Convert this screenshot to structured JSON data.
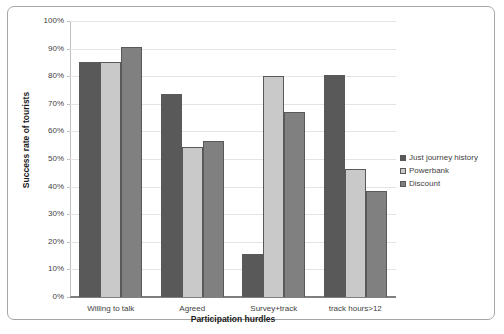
{
  "chart_data": {
    "type": "bar",
    "title": "",
    "xlabel": "Participation hurdles",
    "ylabel": "Success rate of tourists",
    "categories": [
      "Willing to talk",
      "Agreed",
      "Survey+track",
      "track hours>12"
    ],
    "series": [
      {
        "name": "Just journey history",
        "color": "#595959",
        "values": [
          85,
          73.5,
          15.5,
          80.5
        ]
      },
      {
        "name": "Powerbank",
        "color": "#c9c9c9",
        "values": [
          85,
          54.5,
          80,
          46.5
        ]
      },
      {
        "name": "Discount",
        "color": "#808080",
        "values": [
          90.5,
          56.5,
          67,
          38.5
        ]
      }
    ],
    "ylim": [
      0,
      100
    ],
    "ytick_values": [
      0,
      10,
      20,
      30,
      40,
      50,
      60,
      70,
      80,
      90,
      100
    ],
    "ytick_labels": [
      "0%",
      "10%",
      "20%",
      "30%",
      "40%",
      "50%",
      "60%",
      "70%",
      "80%",
      "90%",
      "100%"
    ],
    "grid": true,
    "grid_axis": "y",
    "legend_position": "right",
    "bar_border_color": "#595959",
    "gridline_color": "#e4e4e4",
    "axis_color": "#7f7f7f",
    "frame_border_color": "#a6a6a6",
    "background_color": "#ffffff"
  }
}
